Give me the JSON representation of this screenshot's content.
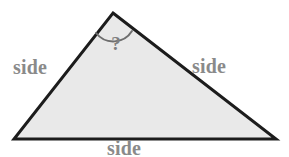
{
  "figure": {
    "background_color": "#ffffff"
  },
  "triangle": {
    "fill_color": "#e9e9e9",
    "stroke_color": "#1c1c1c",
    "stroke_width": 3,
    "vertices": {
      "apex": {
        "x": 113,
        "y": 13
      },
      "bottom_left": {
        "x": 14,
        "y": 139
      },
      "bottom_right": {
        "x": 276,
        "y": 139
      }
    }
  },
  "angle_marker": {
    "name": "apex-angle-arc",
    "stroke_color": "#6e6e6e",
    "stroke_width": 2,
    "radius": 22,
    "path": "M 96 33 A 22 22 0 0 0 132 31"
  },
  "labels": {
    "side_left": "side",
    "side_right": "side",
    "side_bottom": "side",
    "angle_unknown": "?",
    "label_color": "#8a8a8a",
    "angle_label_color": "#7f7f7f"
  }
}
